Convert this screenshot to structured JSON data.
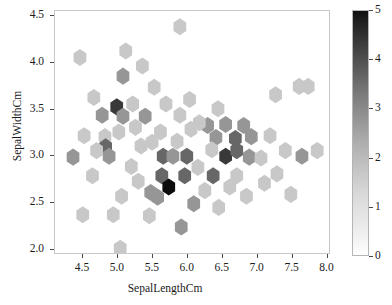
{
  "chart_data": {
    "type": "heatmap",
    "subtype": "hexbin",
    "title": "",
    "xlabel": "SepalLengthCm",
    "ylabel": "SepalWidthCm",
    "xlim": [
      4.1,
      8.05
    ],
    "ylim": [
      1.95,
      4.55
    ],
    "xticks": [
      4.5,
      5.0,
      5.5,
      6.0,
      6.5,
      7.0,
      7.5,
      8.0
    ],
    "xticklabels": [
      "4.5",
      "5.0",
      "5.5",
      "6.0",
      "6.5",
      "7.0",
      "7.5",
      "8.0"
    ],
    "yticks": [
      2.0,
      2.5,
      3.0,
      3.5,
      4.0,
      4.5
    ],
    "yticklabels": [
      "2.0",
      "2.5",
      "3.0",
      "3.5",
      "4.0",
      "4.5"
    ],
    "grid": false,
    "legend": "none",
    "colorbar": {
      "label": "",
      "vmin": 0,
      "vmax": 5,
      "ticks": [
        0,
        1,
        2,
        3,
        4,
        5
      ],
      "ticklabels": [
        "0",
        "1",
        "2",
        "3",
        "4",
        "5"
      ],
      "colormap": "Greys",
      "position": "right",
      "low_color": "#ffffff",
      "high_color": "#101010"
    },
    "hexagons": [
      {
        "x": 5.9,
        "y": 4.38,
        "c": 1
      },
      {
        "x": 5.36,
        "y": 3.96,
        "c": 1
      },
      {
        "x": 5.08,
        "y": 3.85,
        "c": 2
      },
      {
        "x": 5.53,
        "y": 3.73,
        "c": 1
      },
      {
        "x": 7.62,
        "y": 3.74,
        "c": 1
      },
      {
        "x": 7.75,
        "y": 3.74,
        "c": 1
      },
      {
        "x": 4.66,
        "y": 3.62,
        "c": 1
      },
      {
        "x": 7.28,
        "y": 3.65,
        "c": 1
      },
      {
        "x": 4.99,
        "y": 3.52,
        "c": 4
      },
      {
        "x": 4.78,
        "y": 3.43,
        "c": 2
      },
      {
        "x": 5.08,
        "y": 3.42,
        "c": 2
      },
      {
        "x": 5.4,
        "y": 3.42,
        "c": 2
      },
      {
        "x": 5.9,
        "y": 3.43,
        "c": 1
      },
      {
        "x": 4.52,
        "y": 3.21,
        "c": 1
      },
      {
        "x": 4.82,
        "y": 3.2,
        "c": 1
      },
      {
        "x": 6.3,
        "y": 3.32,
        "c": 2
      },
      {
        "x": 6.56,
        "y": 3.33,
        "c": 2
      },
      {
        "x": 6.82,
        "y": 3.32,
        "c": 2
      },
      {
        "x": 7.2,
        "y": 3.21,
        "c": 1
      },
      {
        "x": 4.83,
        "y": 3.09,
        "c": 3
      },
      {
        "x": 6.42,
        "y": 3.19,
        "c": 2
      },
      {
        "x": 6.7,
        "y": 3.18,
        "c": 3
      },
      {
        "x": 6.93,
        "y": 3.2,
        "c": 2
      },
      {
        "x": 4.36,
        "y": 2.98,
        "c": 2
      },
      {
        "x": 4.88,
        "y": 2.99,
        "c": 2
      },
      {
        "x": 5.66,
        "y": 2.99,
        "c": 3
      },
      {
        "x": 5.8,
        "y": 2.99,
        "c": 2
      },
      {
        "x": 6.0,
        "y": 2.99,
        "c": 3
      },
      {
        "x": 6.36,
        "y": 3.06,
        "c": 1
      },
      {
        "x": 6.56,
        "y": 2.99,
        "c": 4
      },
      {
        "x": 6.72,
        "y": 3.05,
        "c": 3
      },
      {
        "x": 6.9,
        "y": 2.98,
        "c": 2
      },
      {
        "x": 7.07,
        "y": 2.97,
        "c": 1
      },
      {
        "x": 7.66,
        "y": 2.99,
        "c": 2
      },
      {
        "x": 5.2,
        "y": 2.88,
        "c": 1
      },
      {
        "x": 6.16,
        "y": 2.87,
        "c": 1
      },
      {
        "x": 5.64,
        "y": 2.78,
        "c": 3
      },
      {
        "x": 5.97,
        "y": 2.78,
        "c": 3
      },
      {
        "x": 6.38,
        "y": 2.78,
        "c": 3
      },
      {
        "x": 6.72,
        "y": 2.78,
        "c": 1
      },
      {
        "x": 7.3,
        "y": 2.8,
        "c": 1
      },
      {
        "x": 5.74,
        "y": 2.66,
        "c": 5
      },
      {
        "x": 5.48,
        "y": 2.6,
        "c": 2
      },
      {
        "x": 5.58,
        "y": 2.55,
        "c": 2
      },
      {
        "x": 6.86,
        "y": 2.56,
        "c": 1
      },
      {
        "x": 7.5,
        "y": 2.58,
        "c": 1
      },
      {
        "x": 4.5,
        "y": 2.36,
        "c": 1
      },
      {
        "x": 4.94,
        "y": 2.36,
        "c": 1
      },
      {
        "x": 5.46,
        "y": 2.35,
        "c": 1
      },
      {
        "x": 6.1,
        "y": 2.48,
        "c": 2
      },
      {
        "x": 6.46,
        "y": 2.44,
        "c": 1
      },
      {
        "x": 5.92,
        "y": 2.23,
        "c": 2
      },
      {
        "x": 5.04,
        "y": 2.0,
        "c": 1
      },
      {
        "x": 5.26,
        "y": 3.3,
        "c": 1
      },
      {
        "x": 5.62,
        "y": 3.25,
        "c": 1
      },
      {
        "x": 6.06,
        "y": 3.28,
        "c": 1
      },
      {
        "x": 6.18,
        "y": 3.35,
        "c": 1
      },
      {
        "x": 5.22,
        "y": 3.55,
        "c": 1
      },
      {
        "x": 5.7,
        "y": 3.55,
        "c": 1
      },
      {
        "x": 6.45,
        "y": 3.5,
        "c": 1
      },
      {
        "x": 4.7,
        "y": 3.05,
        "c": 1
      },
      {
        "x": 5.02,
        "y": 3.25,
        "c": 1
      },
      {
        "x": 5.34,
        "y": 3.1,
        "c": 1
      },
      {
        "x": 5.5,
        "y": 3.14,
        "c": 1
      },
      {
        "x": 6.62,
        "y": 2.66,
        "c": 1
      },
      {
        "x": 7.12,
        "y": 2.7,
        "c": 1
      },
      {
        "x": 5.3,
        "y": 2.72,
        "c": 1
      },
      {
        "x": 5.06,
        "y": 2.56,
        "c": 1
      },
      {
        "x": 4.64,
        "y": 2.78,
        "c": 1
      },
      {
        "x": 6.26,
        "y": 2.62,
        "c": 1
      },
      {
        "x": 7.42,
        "y": 3.05,
        "c": 1
      },
      {
        "x": 7.88,
        "y": 3.05,
        "c": 1
      },
      {
        "x": 5.12,
        "y": 4.12,
        "c": 1
      },
      {
        "x": 4.46,
        "y": 4.05,
        "c": 1
      },
      {
        "x": 5.86,
        "y": 3.15,
        "c": 1
      },
      {
        "x": 6.04,
        "y": 3.6,
        "c": 1
      }
    ]
  },
  "axis": {
    "xlabel": "SepalLengthCm",
    "ylabel": "SepalWidthCm"
  }
}
